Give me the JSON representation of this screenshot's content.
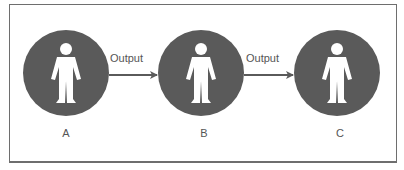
{
  "diagram": {
    "nodes": [
      {
        "id": "A",
        "label": "A",
        "icon": "person-icon"
      },
      {
        "id": "B",
        "label": "B",
        "icon": "person-icon"
      },
      {
        "id": "C",
        "label": "C",
        "icon": "person-icon"
      }
    ],
    "edges": [
      {
        "from": "A",
        "to": "B",
        "label": "Output"
      },
      {
        "from": "B",
        "to": "C",
        "label": "Output"
      }
    ],
    "colors": {
      "circle": "#5a5a5a",
      "figure": "#ffffff",
      "arrow": "#5a5a5a",
      "text": "#555555",
      "border": "#6e6e6e"
    }
  }
}
